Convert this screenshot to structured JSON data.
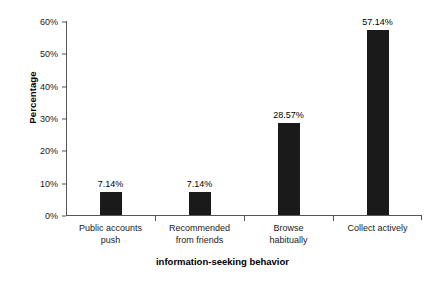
{
  "chart_data": {
    "type": "bar",
    "title": "",
    "xlabel": "information-seeking behavior",
    "ylabel": "Percentage",
    "categories": [
      "Public accounts push",
      "Recommended from friends",
      "Browse habitually",
      "Collect actively"
    ],
    "category_lines": [
      [
        "Public accounts",
        "push"
      ],
      [
        "Recommended",
        "from friends"
      ],
      [
        "Browse",
        "habitually"
      ],
      [
        "Collect actively",
        ""
      ]
    ],
    "values": [
      7.14,
      7.14,
      28.57,
      57.14
    ],
    "value_labels": [
      "7.14%",
      "7.14%",
      "28.57%",
      "57.14%"
    ],
    "ylim": [
      0,
      60
    ],
    "ytick_values": [
      0,
      10,
      20,
      30,
      40,
      50,
      60
    ],
    "ytick_labels": [
      "0%",
      "10%",
      "20%",
      "30%",
      "40%",
      "50%",
      "60%"
    ],
    "grid": false,
    "legend": false,
    "bar_color": "#1a1a1a",
    "axis_color": "#555555",
    "background_color": "#ffffff"
  }
}
